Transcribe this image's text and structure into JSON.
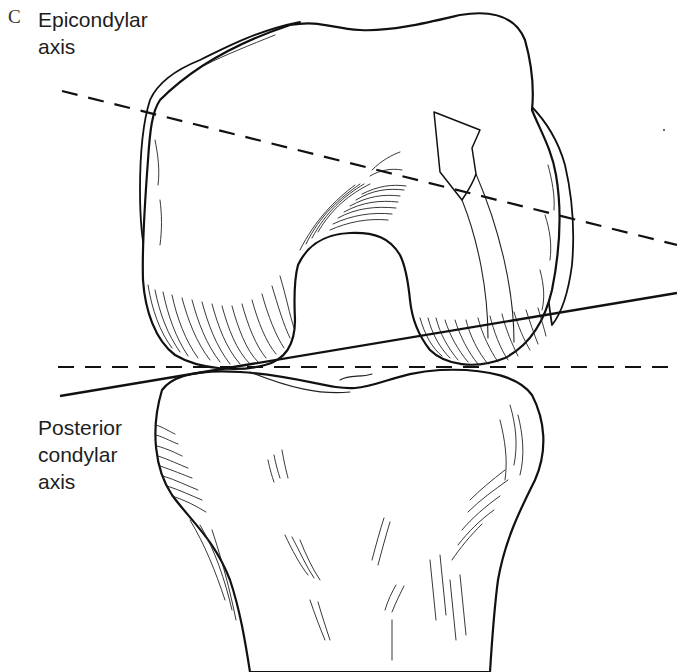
{
  "figure": {
    "panel_letter": "C"
  },
  "labels": {
    "epicondylar_axis": [
      "Epicondylar",
      "axis"
    ],
    "posterior_condylar_axis": [
      "Posterior",
      "condylar",
      "axis"
    ]
  },
  "axes": [
    {
      "name": "Epicondylar axis",
      "style": "dashed",
      "from": [
        62,
        91
      ],
      "to": [
        677,
        245
      ]
    },
    {
      "name": "Posterior condylar axis",
      "style": "solid",
      "from": [
        60,
        396
      ],
      "to": [
        677,
        293
      ]
    },
    {
      "name": "Horizontal reference",
      "style": "dashed",
      "from": [
        58,
        367
      ],
      "to": [
        677,
        367
      ]
    }
  ],
  "annotations": {
    "rotation_arrow": "Curved arrow indicating external rotation"
  },
  "colors": {
    "ink": "#111111",
    "background": "#ffffff"
  }
}
